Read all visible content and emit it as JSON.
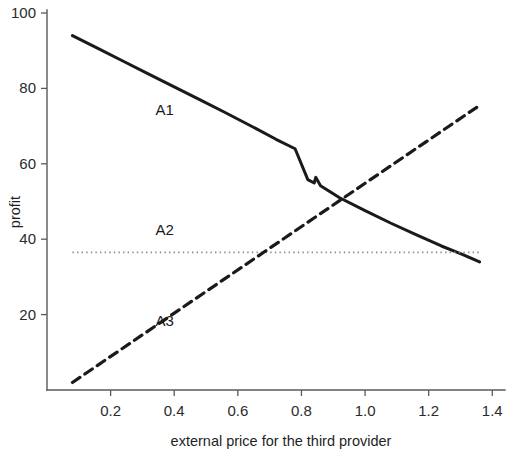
{
  "chart_data": {
    "type": "line",
    "title": "",
    "xlabel": "external price for the third provider",
    "ylabel": "profit",
    "xlim": [
      0.0,
      1.44
    ],
    "ylim": [
      0,
      100
    ],
    "xticks": [
      0.2,
      0.4,
      0.6,
      0.8,
      1.0,
      1.2,
      1.4
    ],
    "xticklabels": [
      "0.2",
      "0.4",
      "0.6",
      "0.8",
      "1.0",
      "1.2",
      "1.4"
    ],
    "yticks": [
      20,
      40,
      60,
      80,
      100
    ],
    "yticklabels": [
      "20",
      "40",
      "60",
      "80",
      "100"
    ],
    "grid": false,
    "legend_position": "inline-annotations",
    "series": [
      {
        "name": "A1",
        "style": "solid",
        "color": "#1a1a1a",
        "label_x": 0.37,
        "label_y": 73,
        "x": [
          0.08,
          0.16,
          0.24,
          0.32,
          0.4,
          0.48,
          0.56,
          0.64,
          0.72,
          0.78,
          0.82,
          0.84,
          0.845,
          0.86,
          0.92,
          1.0,
          1.08,
          1.16,
          1.24,
          1.3,
          1.36
        ],
        "y": [
          94.0,
          90.6,
          87.2,
          83.8,
          80.4,
          77.0,
          73.6,
          70.1,
          66.5,
          64.0,
          55.8,
          54.9,
          56.4,
          54.2,
          51.0,
          47.6,
          44.3,
          41.2,
          38.2,
          36.2,
          34.0
        ]
      },
      {
        "name": "A2",
        "style": "dotted",
        "color": "#8c8c8c",
        "label_x": 0.37,
        "label_y": 41,
        "x": [
          0.08,
          1.36
        ],
        "y": [
          36.5,
          36.5
        ]
      },
      {
        "name": "A3",
        "style": "dashed",
        "color": "#1a1a1a",
        "label_x": 0.37,
        "label_y": 17,
        "x": [
          0.08,
          1.36
        ],
        "y": [
          2.0,
          75.5
        ]
      }
    ]
  },
  "axis": {
    "ylabel": "profit",
    "xlabel": "external price for the third provider"
  }
}
